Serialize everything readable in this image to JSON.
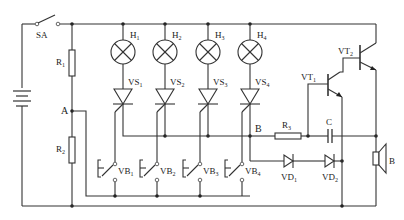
{
  "diagram": {
    "type": "circuit-schematic",
    "colors": {
      "line": "#333333",
      "background": "#ffffff"
    },
    "labels": {
      "switch": "SA",
      "r1": "R",
      "r1_sub": "1",
      "r2": "R",
      "r2_sub": "2",
      "r3": "R",
      "r3_sub": "3",
      "node_a": "A",
      "node_b": "B",
      "capacitor": "C",
      "speaker": "B",
      "vt1": "VT",
      "vt1_sub": "1",
      "vt2": "VT",
      "vt2_sub": "2",
      "vd1": "VD",
      "vd1_sub": "1",
      "vd2": "VD",
      "vd2_sub": "2"
    },
    "channels": [
      {
        "lamp": "H",
        "lamp_sub": "1",
        "thyristor": "VS",
        "thyristor_sub": "1",
        "button": "VB",
        "button_sub": "1"
      },
      {
        "lamp": "H",
        "lamp_sub": "2",
        "thyristor": "VS",
        "thyristor_sub": "2",
        "button": "VB",
        "button_sub": "2"
      },
      {
        "lamp": "H",
        "lamp_sub": "3",
        "thyristor": "VS",
        "thyristor_sub": "3",
        "button": "VB",
        "button_sub": "3"
      },
      {
        "lamp": "H",
        "lamp_sub": "4",
        "thyristor": "VS",
        "thyristor_sub": "4",
        "button": "VB",
        "button_sub": "4"
      }
    ]
  }
}
